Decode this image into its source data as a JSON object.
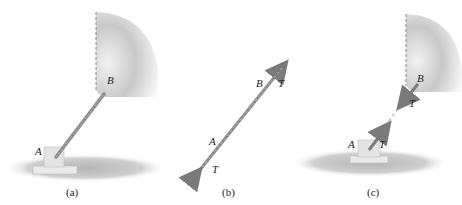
{
  "figure": {
    "panels": [
      {
        "id": "a",
        "caption": "(a)",
        "labels": {
          "A": "A",
          "B": "B"
        },
        "description": "Member AB attached to wall at B and to floor bracket at A"
      },
      {
        "id": "b",
        "caption": "(b)",
        "labels": {
          "A": "A",
          "B": "B",
          "T_top": "T",
          "T_bottom": "T"
        },
        "description": "Free-body diagram of member AB with tension T at both ends"
      },
      {
        "id": "c",
        "caption": "(c)",
        "labels": {
          "A": "A",
          "B": "B",
          "T_wall": "T",
          "T_bracket": "T"
        },
        "description": "Forces T exerted on wall at B and on bracket at A"
      }
    ],
    "colors": {
      "rod": "#8a8a8a",
      "arrow": "#7a7a7a",
      "wall": "#c9c9c9",
      "floor_shadow": "#bdbdbd",
      "text": "#222222"
    }
  }
}
